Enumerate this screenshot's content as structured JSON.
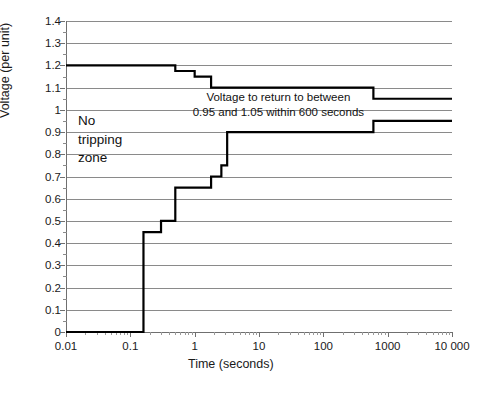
{
  "chart_data": {
    "type": "line",
    "title": "",
    "xlabel": "Time (seconds)",
    "ylabel": "Voltage (per unit)",
    "xscale": "log",
    "xlim": [
      0.01,
      10000
    ],
    "ylim": [
      0,
      1.4
    ],
    "grid": true,
    "legend": "none",
    "xticks": [
      "0.01",
      "0.1",
      "1",
      "10",
      "100",
      "1000",
      "10 000"
    ],
    "xtick_values": [
      0.01,
      0.1,
      1,
      10,
      100,
      1000,
      10000
    ],
    "yticks": [
      "0",
      "0.1",
      "0.2",
      "0.3",
      "0.4",
      "0.5",
      "0.6",
      "0.7",
      "0.8",
      "0.9",
      "1",
      "1.1",
      "1.2",
      "1.3",
      "1.4"
    ],
    "ytick_values": [
      0,
      0.1,
      0.2,
      0.3,
      0.4,
      0.5,
      0.6,
      0.7,
      0.8,
      0.9,
      1.0,
      1.1,
      1.2,
      1.3,
      1.4
    ],
    "series": [
      {
        "name": "Upper voltage limit",
        "style": "step",
        "points": [
          {
            "t": 0.01,
            "v": 1.2
          },
          {
            "t": 0.5,
            "v": 1.2
          },
          {
            "t": 0.5,
            "v": 1.175
          },
          {
            "t": 1.0,
            "v": 1.175
          },
          {
            "t": 1.0,
            "v": 1.15
          },
          {
            "t": 1.8,
            "v": 1.15
          },
          {
            "t": 1.8,
            "v": 1.1
          },
          {
            "t": 600,
            "v": 1.1
          },
          {
            "t": 600,
            "v": 1.05
          },
          {
            "t": 10000,
            "v": 1.05
          }
        ]
      },
      {
        "name": "Lower voltage limit",
        "style": "step",
        "points": [
          {
            "t": 0.01,
            "v": 0.0
          },
          {
            "t": 0.16,
            "v": 0.0
          },
          {
            "t": 0.16,
            "v": 0.45
          },
          {
            "t": 0.3,
            "v": 0.45
          },
          {
            "t": 0.3,
            "v": 0.5
          },
          {
            "t": 0.5,
            "v": 0.5
          },
          {
            "t": 0.5,
            "v": 0.65
          },
          {
            "t": 1.8,
            "v": 0.65
          },
          {
            "t": 1.8,
            "v": 0.7
          },
          {
            "t": 2.6,
            "v": 0.7
          },
          {
            "t": 2.6,
            "v": 0.75
          },
          {
            "t": 3.2,
            "v": 0.75
          },
          {
            "t": 3.2,
            "v": 0.9
          },
          {
            "t": 600,
            "v": 0.9
          },
          {
            "t": 600,
            "v": 0.95
          },
          {
            "t": 10000,
            "v": 0.95
          }
        ]
      }
    ],
    "annotations": [
      {
        "id": "return-note-line1",
        "text": "Voltage to return to between",
        "t_center": 20,
        "v": 1.055
      },
      {
        "id": "return-note-line2",
        "text": "0.95 and 1.05 within 600 seconds",
        "t_center": 20,
        "v": 0.985
      },
      {
        "id": "no-tripping-zone",
        "text": "No\ntripping\nzone",
        "lines": [
          "No",
          "tripping",
          "zone"
        ],
        "t_center": 0.05,
        "v": 0.9
      }
    ],
    "colors": {
      "curve": "#000000",
      "grid": "#8a8a8a",
      "axis": "#6f6f6f",
      "text": "#111111",
      "background": "#ffffff"
    }
  },
  "axes": {
    "y_title": "Voltage (per unit)",
    "x_title": "Time (seconds)",
    "y_tick_labels": [
      "1.4",
      "1.3",
      "1.2",
      "1.1",
      "1",
      "0.9",
      "0.8",
      "0.7",
      "0.6",
      "0.5",
      "0.4",
      "0.3",
      "0.2",
      "0.1",
      "0"
    ],
    "x_tick_labels": [
      "0.01",
      "0.1",
      "1",
      "10",
      "100",
      "1000",
      "10 000"
    ]
  },
  "annotations": {
    "return_line1": "Voltage to return to between",
    "return_line2": "0.95 and 1.05 within 600 seconds",
    "zone_line1": "No",
    "zone_line2": "tripping",
    "zone_line3": "zone"
  }
}
